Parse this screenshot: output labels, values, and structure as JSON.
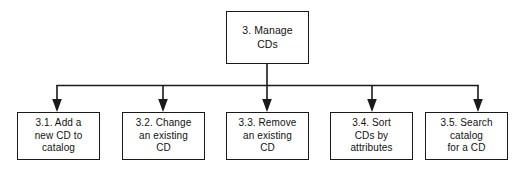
{
  "diagram": {
    "type": "hierarchy-tree",
    "title": "",
    "orientation": "top-down",
    "canvas": {
      "width": 532,
      "height": 170,
      "background": "#ffffff"
    },
    "line_color": "#1a1a1a",
    "box_border_color": "#1a1a1a",
    "box_fill_color": "#ffffff",
    "text_color": "#111111",
    "root": {
      "id": "3",
      "number": "3.",
      "label": "3. Manage\nCDs",
      "title": "Manage CDs"
    },
    "children": [
      {
        "id": "3.1",
        "number": "3.1.",
        "label": "3.1. Add a\nnew CD to\ncatalog",
        "title": "Add a new CD to catalog"
      },
      {
        "id": "3.2",
        "number": "3.2.",
        "label": "3.2. Change\nan existing\nCD",
        "title": "Change an existing CD"
      },
      {
        "id": "3.3",
        "number": "3.3.",
        "label": "3.3. Remove\nan existing\nCD",
        "title": "Remove an existing CD"
      },
      {
        "id": "3.4",
        "number": "3.4.",
        "label": "3.4. Sort\nCDs by\nattributes",
        "title": "Sort CDs by attributes"
      },
      {
        "id": "3.5",
        "number": "3.5.",
        "label": "3.5. Search\ncatalog\nfor a CD",
        "title": "Search catalog for a CD"
      }
    ],
    "connectors": {
      "stem": {
        "from_x": 267,
        "from_y": 64,
        "to_y": 85
      },
      "bus": {
        "y": 85,
        "x_start": 57,
        "x_end": 478
      },
      "arrow_x_positions": [
        57,
        163,
        267,
        372,
        478
      ],
      "arrow_to_y": 112
    }
  }
}
